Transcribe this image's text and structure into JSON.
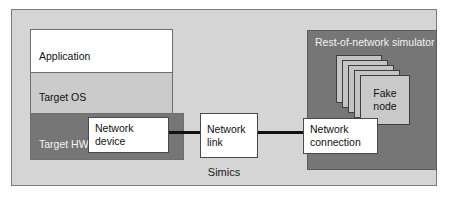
{
  "diagram": {
    "type": "block-diagram",
    "outer_container": {
      "label": "Simics",
      "fill": "#d5d5d5",
      "border": "#7a7a7a"
    },
    "target_stack": {
      "layers": [
        {
          "label": "Application",
          "fill": "#ffffff"
        },
        {
          "label": "Target OS",
          "fill": "#cbcbcb"
        },
        {
          "label": "Target HW",
          "fill": "#767676"
        }
      ]
    },
    "simulator": {
      "title": "Rest-of-network simulator",
      "fill": "#767676",
      "node_stack": {
        "front_label": "Fake\nnode",
        "card_count": 5,
        "card_fill": "#c4c4c4"
      }
    },
    "boxes": [
      {
        "label": "Network\ndevice"
      },
      {
        "label": "Network\nlink"
      },
      {
        "label": "Network\nconnection"
      }
    ],
    "connectors": [
      {
        "from": "Network device",
        "to": "Network link",
        "color": "#111111"
      },
      {
        "from": "Network link",
        "to": "Network connection",
        "color": "#111111"
      }
    ]
  }
}
